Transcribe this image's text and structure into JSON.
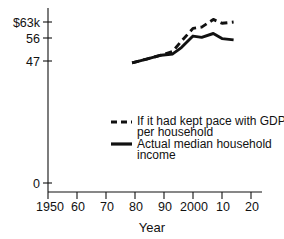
{
  "chart_data": {
    "type": "line",
    "title": "",
    "xlabel": "Year",
    "ylabel": "",
    "xlim": [
      1950,
      2020
    ],
    "ylim": [
      0,
      66
    ],
    "grid": false,
    "legend_position": "center",
    "x_ticks": [
      {
        "value": 1950,
        "label": "1950"
      },
      {
        "value": 1960,
        "label": "60"
      },
      {
        "value": 1970,
        "label": "70"
      },
      {
        "value": 1980,
        "label": "80"
      },
      {
        "value": 1990,
        "label": "90"
      },
      {
        "value": 2000,
        "label": "2000"
      },
      {
        "value": 2010,
        "label": "10"
      },
      {
        "value": 2020,
        "label": "20"
      }
    ],
    "y_ticks": [
      {
        "value": 0,
        "label": "0"
      },
      {
        "value": 47,
        "label": "47"
      },
      {
        "value": 56,
        "label": "56"
      },
      {
        "value": 63,
        "label": "$63k"
      }
    ],
    "series": [
      {
        "name": "If it had kept pace with GDP per household",
        "style": "dashed",
        "color": "#111111",
        "x": [
          1979,
          1984,
          1989,
          1993,
          1996,
          2000,
          2003,
          2007,
          2010,
          2014
        ],
        "values": [
          47.0,
          48.5,
          50.0,
          51.5,
          55.5,
          60.5,
          61.0,
          64.0,
          62.5,
          63.0
        ]
      },
      {
        "name": "Actual median household income",
        "style": "solid",
        "color": "#111111",
        "x": [
          1979,
          1984,
          1989,
          1993,
          1996,
          2000,
          2003,
          2007,
          2010,
          2014
        ],
        "values": [
          47.0,
          48.5,
          50.0,
          50.5,
          53.0,
          57.5,
          57.0,
          58.5,
          56.5,
          56.0
        ]
      }
    ],
    "legend": [
      {
        "style": "dashed",
        "lines": [
          "If it had kept pace with GDP",
          "per household"
        ]
      },
      {
        "style": "solid",
        "lines": [
          "Actual median household",
          "income"
        ]
      }
    ]
  }
}
